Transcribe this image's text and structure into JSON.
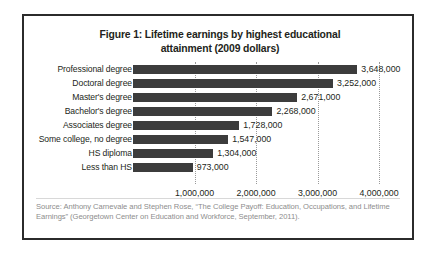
{
  "figure": {
    "title": "Figure 1: Lifetime earnings by highest educational attainment (2009 dollars)",
    "title_line1": "Figure 1: Lifetime earnings by highest educational",
    "title_line2": "attainment (2009 dollars)",
    "source_line1": "Source: Anthony Carnevale  and Stephen Rose, “The College Payoff: Education, Occupations, and",
    "source_line2": "Lifetime Earnings” (Georgetown Center on Education and Workforce, September, 2011)."
  },
  "chart_data": {
    "type": "bar",
    "orientation": "horizontal",
    "title": "Figure 1: Lifetime earnings by highest educational attainment (2009 dollars)",
    "xlabel": "",
    "ylabel": "",
    "xlim": [
      0,
      4200000
    ],
    "grid": true,
    "legend": null,
    "categories": [
      "Professional degree",
      "Doctoral degree",
      "Master's degree",
      "Bachelor's degree",
      "Associates degree",
      "Some college, no degree",
      "HS diploma",
      "Less than HS"
    ],
    "values": [
      3648000,
      3252000,
      2671000,
      2268000,
      1728000,
      1547000,
      1304000,
      973000
    ],
    "value_labels": [
      "3,648,000",
      "3,252,000",
      "2,671,000",
      "2,268,000",
      "1,728,000",
      "1,547,000",
      "1,304,000",
      "973,000"
    ],
    "xticks": [
      1000000,
      2000000,
      3000000,
      4000000
    ],
    "xtick_labels": [
      "1,000,000",
      "2,000,000",
      "3,000,000",
      "4,000,000"
    ],
    "bar_color": "#3c3c3c",
    "gridline_color": "#9a9a9a",
    "text_color": "#231f20"
  }
}
